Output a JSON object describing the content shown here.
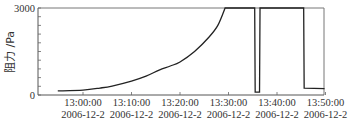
{
  "chart_data": {
    "type": "line",
    "title": "",
    "xlabel": "",
    "ylabel": "阻力 /Pa",
    "ylim": [
      0,
      3000
    ],
    "y_ticks": [
      {
        "value": 0,
        "label": "0"
      },
      {
        "value": 3000,
        "label": "3000"
      }
    ],
    "x_ticks": [
      {
        "time": "13:00:00",
        "date": "2006-12-2"
      },
      {
        "time": "13:10:00",
        "date": "2006-12-2"
      },
      {
        "time": "13:20:00",
        "date": "2006-12-2"
      },
      {
        "time": "13:30:00",
        "date": "2006-12-2"
      },
      {
        "time": "13:40:00",
        "date": "2006-12-2"
      },
      {
        "time": "13:50:00",
        "date": "2006-12-2"
      }
    ],
    "xlim_minutes_from_13h": [
      -7.9,
      50
    ],
    "grid": false,
    "legend": null,
    "series": [
      {
        "name": "阻力",
        "color": "#222222",
        "points_minutes_vs_pa": [
          [
            -5.2,
            140
          ],
          [
            0,
            170
          ],
          [
            3.5,
            240
          ],
          [
            6.0,
            310
          ],
          [
            10.0,
            480
          ],
          [
            13.0,
            650
          ],
          [
            15.7,
            860
          ],
          [
            18.0,
            1000
          ],
          [
            20.0,
            1140
          ],
          [
            23.0,
            1500
          ],
          [
            26.0,
            2000
          ],
          [
            27.8,
            2400
          ],
          [
            29.3,
            3000
          ],
          [
            35.4,
            3000
          ],
          [
            35.5,
            100
          ],
          [
            36.4,
            100
          ],
          [
            36.5,
            3000
          ],
          [
            45.5,
            3000
          ],
          [
            45.6,
            240
          ],
          [
            49.8,
            220
          ]
        ]
      }
    ]
  }
}
